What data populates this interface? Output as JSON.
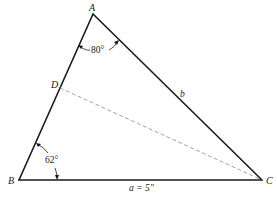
{
  "diagram": {
    "vertices": {
      "A": {
        "label": "A",
        "x": 93,
        "y": 14
      },
      "B": {
        "label": "B",
        "x": 19,
        "y": 180
      },
      "C": {
        "label": "C",
        "x": 262,
        "y": 180
      },
      "D": {
        "label": "D",
        "x": 60,
        "y": 88
      }
    },
    "angles": {
      "A": {
        "label": "80°"
      },
      "B": {
        "label": "62°"
      }
    },
    "sides": {
      "a": {
        "label": "a = 5\""
      },
      "b": {
        "label": "b"
      }
    },
    "segments": [
      {
        "from": "A",
        "to": "B",
        "style": "solid"
      },
      {
        "from": "B",
        "to": "C",
        "style": "solid"
      },
      {
        "from": "C",
        "to": "A",
        "style": "solid"
      },
      {
        "from": "D",
        "to": "C",
        "style": "dashed"
      }
    ],
    "colors": {
      "line": "#1a1a1a",
      "dashed": "#8a8a8a",
      "background": "#ffffff"
    }
  }
}
